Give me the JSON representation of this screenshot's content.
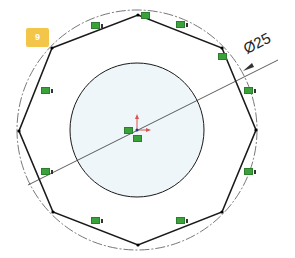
{
  "sketch": {
    "badge_label": "9",
    "diameter_dimension": "Ø25",
    "colors": {
      "sketch_line": "#1a1a1a",
      "construction_line": "#555555",
      "inner_fill": "#eef6fa",
      "relation_icon": "#3aa23a",
      "origin_axis": "#d9534f",
      "badge": "#f3c64a"
    },
    "relations": [
      {
        "type": "equal",
        "label": "equal-relation"
      },
      {
        "type": "coincident",
        "label": "coincident-relation"
      },
      {
        "type": "equal",
        "label": "equal-relation"
      },
      {
        "type": "coincident",
        "label": "coincident-relation"
      },
      {
        "type": "equal",
        "label": "equal-relation"
      },
      {
        "type": "equal",
        "label": "equal-relation"
      },
      {
        "type": "equal",
        "label": "equal-relation"
      },
      {
        "type": "equal",
        "label": "equal-relation"
      },
      {
        "type": "equal",
        "label": "equal-relation"
      },
      {
        "type": "equal",
        "label": "equal-relation"
      },
      {
        "type": "fixed",
        "label": "origin-relation"
      },
      {
        "type": "coincident",
        "label": "origin-coincident-relation"
      }
    ]
  }
}
